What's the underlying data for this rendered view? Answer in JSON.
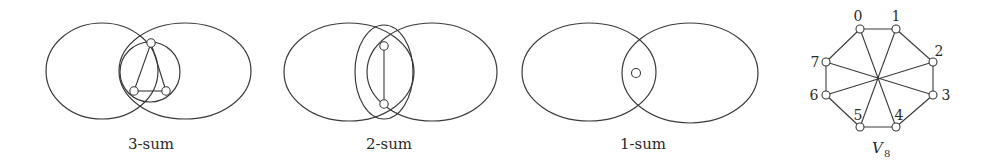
{
  "panels": [
    {
      "id": "three-sum",
      "caption": "3-sum"
    },
    {
      "id": "two-sum",
      "caption": "2-sum"
    },
    {
      "id": "one-sum",
      "caption": "1-sum"
    }
  ],
  "v8": {
    "title": "V",
    "subscript": "8",
    "vertex_labels": [
      "0",
      "1",
      "2",
      "3",
      "4",
      "5",
      "6",
      "7"
    ]
  }
}
